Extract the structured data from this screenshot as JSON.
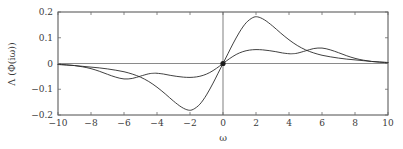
{
  "chart_data": {
    "type": "line",
    "title": "",
    "subtitle": "",
    "xlabel": "ω",
    "ylabel": "Λ (Φ(iω))",
    "xlim": [
      -10,
      10
    ],
    "ylim": [
      -0.2,
      0.2
    ],
    "xticks": [
      -10,
      -8,
      -6,
      -4,
      -2,
      0,
      2,
      4,
      6,
      8,
      10
    ],
    "xtick_labels": [
      "−10",
      "−8",
      "−6",
      "−4",
      "−2",
      "0",
      "2",
      "4",
      "6",
      "8",
      "10"
    ],
    "yticks": [
      -0.2,
      -0.1,
      0,
      0.1,
      0.2
    ],
    "ytick_labels": [
      "−0.2",
      "−0.1",
      "0",
      "0.1",
      "0.2"
    ],
    "grid": false,
    "legend": "none",
    "axis_lines": {
      "x_zero": true,
      "y_zero": true
    },
    "markers": [
      {
        "name": "origin-marker",
        "x": 0,
        "y": 0
      }
    ],
    "series": [
      {
        "name": "large-amplitude-curve",
        "color": "#2b2b2b",
        "x": [
          -10,
          -9.5,
          -9,
          -8.5,
          -8,
          -7.5,
          -7,
          -6.5,
          -6,
          -5.5,
          -5,
          -4.5,
          -4,
          -3.5,
          -3,
          -2.5,
          -2.1,
          -1.8,
          -1.4,
          -1,
          -0.6,
          -0.3,
          0,
          0.3,
          0.6,
          1,
          1.4,
          1.8,
          2.1,
          2.5,
          3,
          3.5,
          4,
          4.5,
          5,
          5.5,
          6,
          6.5,
          7,
          7.5,
          8,
          8.5,
          9,
          9.5,
          10
        ],
        "y": [
          -0.004,
          -0.006,
          -0.008,
          -0.011,
          -0.014,
          -0.017,
          -0.021,
          -0.026,
          -0.032,
          -0.041,
          -0.053,
          -0.07,
          -0.092,
          -0.118,
          -0.146,
          -0.17,
          -0.181,
          -0.178,
          -0.158,
          -0.122,
          -0.076,
          -0.038,
          0,
          0.038,
          0.076,
          0.122,
          0.158,
          0.178,
          0.181,
          0.17,
          0.146,
          0.118,
          0.092,
          0.07,
          0.053,
          0.041,
          0.032,
          0.026,
          0.021,
          0.017,
          0.014,
          0.011,
          0.008,
          0.006,
          0.004
        ]
      },
      {
        "name": "small-amplitude-curve",
        "color": "#2b2b2b",
        "x": [
          -10,
          -9.5,
          -9,
          -8.5,
          -8,
          -7.5,
          -7,
          -6.5,
          -6,
          -5.5,
          -5,
          -4.5,
          -4.2,
          -4,
          -3.6,
          -3.2,
          -2.8,
          -2.4,
          -2,
          -1.6,
          -1.2,
          -0.8,
          -0.4,
          0,
          0.4,
          0.8,
          1.2,
          1.6,
          2,
          2.4,
          2.8,
          3.2,
          3.6,
          4,
          4.2,
          4.5,
          5,
          5.5,
          6,
          6.5,
          7,
          7.5,
          8,
          8.5,
          9,
          9.5,
          10
        ],
        "y": [
          -0.0035,
          -0.005,
          -0.008,
          -0.013,
          -0.02,
          -0.03,
          -0.042,
          -0.053,
          -0.06,
          -0.058,
          -0.049,
          -0.04,
          -0.038,
          -0.038,
          -0.041,
          -0.046,
          -0.05,
          -0.053,
          -0.054,
          -0.052,
          -0.046,
          -0.035,
          -0.019,
          0,
          0.019,
          0.035,
          0.046,
          0.052,
          0.054,
          0.053,
          0.05,
          0.046,
          0.041,
          0.038,
          0.038,
          0.04,
          0.049,
          0.058,
          0.06,
          0.053,
          0.042,
          0.03,
          0.02,
          0.013,
          0.008,
          0.005,
          0.0035
        ]
      }
    ],
    "colors": {
      "curve": "#2b2b2b",
      "frame": "#4c4c4c",
      "zero_line": "#8a8a8a",
      "text": "#3a3a3a",
      "background": "#ffffff"
    },
    "plot_box_px": {
      "left": 58,
      "right": 388,
      "top": 12,
      "bottom": 115
    }
  }
}
